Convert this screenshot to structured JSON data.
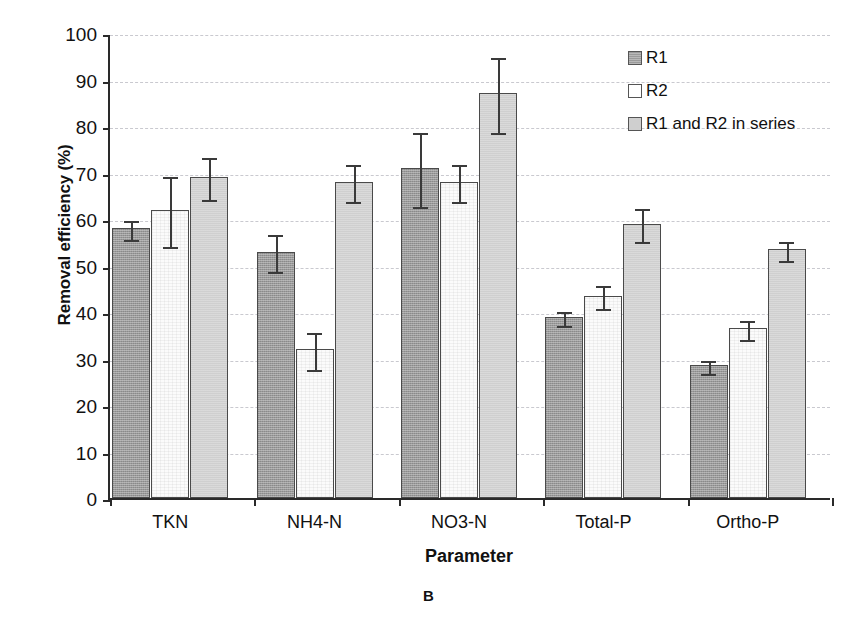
{
  "chart_data": {
    "type": "bar",
    "title": "",
    "panel_label": "B",
    "xlabel": "Parameter",
    "ylabel": "Removal efficiency (%)",
    "categories": [
      "TKN",
      "NH4-N",
      "NO3-N",
      "Total-P",
      "Ortho-P"
    ],
    "ylim": [
      0,
      100
    ],
    "yticks": [
      0,
      10,
      20,
      30,
      40,
      50,
      60,
      70,
      80,
      90,
      100
    ],
    "grid": true,
    "legend_position": "top-right",
    "series": [
      {
        "name": "R1",
        "values": [
          58,
          53,
          71,
          39,
          28.5
        ],
        "errors": [
          2,
          4,
          8,
          1.5,
          1.5
        ]
      },
      {
        "name": "R2",
        "values": [
          62,
          32,
          68,
          43.5,
          36.5
        ],
        "errors": [
          7.5,
          4,
          4,
          2.5,
          2
        ]
      },
      {
        "name": "R1 and R2 in series",
        "values": [
          69,
          68,
          87,
          59,
          53.5
        ],
        "errors": [
          4.5,
          4,
          8,
          3.5,
          2
        ]
      }
    ]
  },
  "legend": {
    "items": [
      {
        "label": "R1"
      },
      {
        "label": "R2"
      },
      {
        "label": "R1 and R2 in series"
      }
    ]
  },
  "colors": {
    "series_1": "#9a9a9a",
    "series_2": "#ffffff",
    "series_3": "#cfcfcf",
    "axis": "#2a2a2a",
    "grid": "#c9c9cf"
  }
}
